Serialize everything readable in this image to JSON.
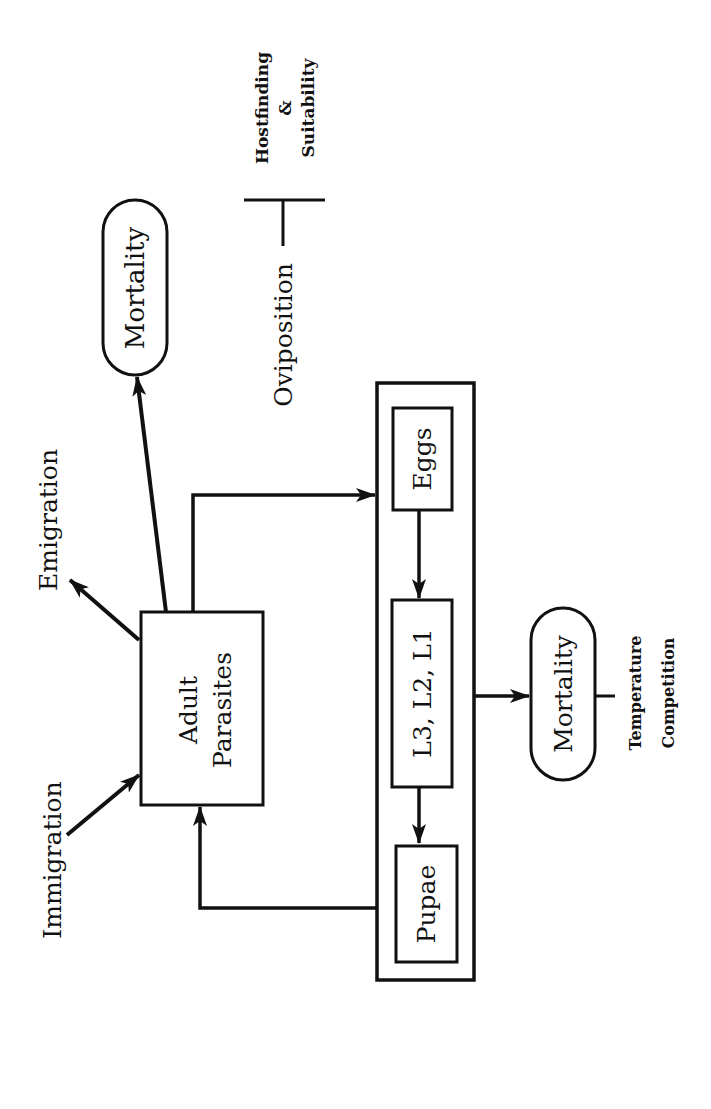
{
  "diagram": {
    "orientation": "rotated-90-ccw",
    "colors": {
      "ink": "#111111",
      "background": "#ffffff"
    },
    "nodes": {
      "adult_parasites": {
        "line1": "Adult",
        "line2": "Parasites"
      },
      "mortality_adult": {
        "label": "Mortality"
      },
      "eggs": {
        "label": "Eggs"
      },
      "larvae": {
        "label": "L3, L2, L1"
      },
      "pupae": {
        "label": "Pupae"
      },
      "mortality_immature": {
        "label": "Mortality"
      }
    },
    "labels": {
      "immigration": "Immigration",
      "emigration": "Emigration",
      "oviposition": "Oviposition",
      "hostfinding": "Hostfinding",
      "ampersand": "&",
      "suitability": "Suitability",
      "temperature": "Temperature",
      "competition": "Competition"
    },
    "edges": [
      {
        "from": "immigration",
        "to": "adult_parasites"
      },
      {
        "from": "adult_parasites",
        "to": "emigration"
      },
      {
        "from": "adult_parasites",
        "to": "mortality_adult"
      },
      {
        "from": "adult_parasites",
        "to": "eggs",
        "label": "oviposition"
      },
      {
        "from": "eggs",
        "to": "larvae"
      },
      {
        "from": "larvae",
        "to": "pupae"
      },
      {
        "from": "immature_group",
        "to": "mortality_immature"
      },
      {
        "from": "pupae",
        "to": "adult_parasites"
      }
    ]
  }
}
